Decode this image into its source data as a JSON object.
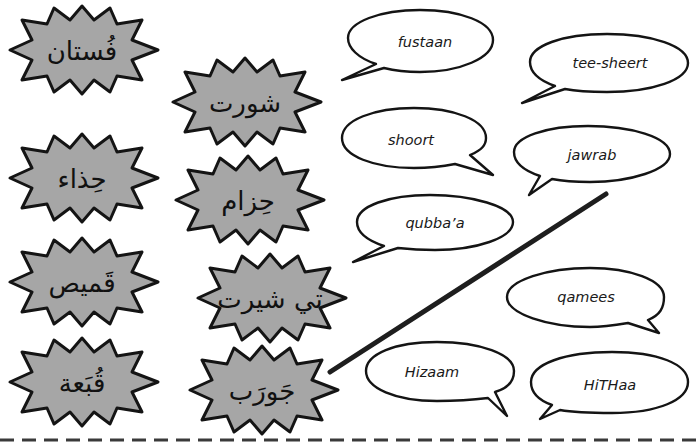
{
  "activity": {
    "type": "matching exercise",
    "instruction_visible": false
  },
  "colors": {
    "starburst_fill": "#a6a6a6",
    "starburst_stroke": "#141414",
    "bubble_fill": "#ffffff",
    "bubble_stroke": "#141414",
    "match_line": "#1e1e1e",
    "dashes": "#3a3a3a"
  },
  "arabic_words": [
    {
      "id": "fustaan-ar",
      "text": "فُستان"
    },
    {
      "id": "shoort-ar",
      "text": "شورت"
    },
    {
      "id": "hithaa-ar",
      "text": "حِذاء"
    },
    {
      "id": "hizaam-ar",
      "text": "حِزام"
    },
    {
      "id": "qamees-ar",
      "text": "قَميص"
    },
    {
      "id": "teesheert-ar",
      "text": "تي شيرت"
    },
    {
      "id": "qubbaa-ar",
      "text": "قُبَعة"
    },
    {
      "id": "jawrab-ar",
      "text": "جَورَب"
    }
  ],
  "transliterations": [
    {
      "id": "fustaan",
      "text": "fustaan"
    },
    {
      "id": "tee-sheert",
      "text": "tee-sheert"
    },
    {
      "id": "shoort",
      "text": "shoort"
    },
    {
      "id": "jawrab",
      "text": "jawrab"
    },
    {
      "id": "qubbaa",
      "text": "qubba’a"
    },
    {
      "id": "qamees",
      "text": "qamees"
    },
    {
      "id": "hizaam",
      "text": "Hizaam"
    },
    {
      "id": "hithaa",
      "text": "HiTHaa"
    }
  ],
  "matches_drawn": [
    {
      "from": "jawrab-ar",
      "to": "jawrab"
    }
  ]
}
